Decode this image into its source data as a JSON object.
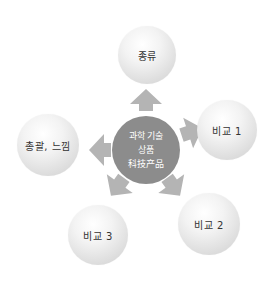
{
  "diagram": {
    "type": "hub-and-spoke",
    "center": {
      "lines": [
        "과학 기술",
        "상품",
        "科技产品"
      ],
      "color": "#8c8c8c",
      "text_color": "#ffffff"
    },
    "nodes": [
      {
        "id": "top",
        "label": "종류"
      },
      {
        "id": "right",
        "label": "비교 1"
      },
      {
        "id": "bottom-right",
        "label": "비교 2"
      },
      {
        "id": "bottom-left",
        "label": "비교 3"
      },
      {
        "id": "left",
        "label": "총괄, 느낌"
      }
    ],
    "arrow_color": "#b4b4b4",
    "arrow_direction": "outward"
  }
}
